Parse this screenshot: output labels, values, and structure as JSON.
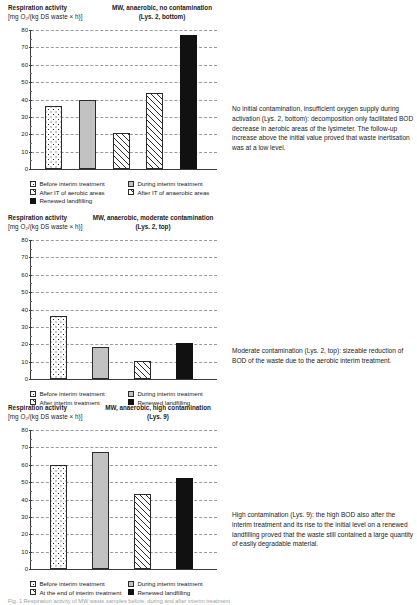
{
  "figure": {
    "caption": "Fig. 1 Respiration activity of MW waste samples before, during and after interim treatment"
  },
  "axis": {
    "y_title": "Respiration activity",
    "y_units": "[mg O₂/(kg DS waste × h)]",
    "ticks": [
      0,
      10,
      20,
      30,
      40,
      50,
      60,
      70,
      80
    ]
  },
  "charts": [
    {
      "id": "lys2-bottom",
      "title_line1": "MW, anaerobic, no contamination",
      "title_line2": "(Lys. 2, bottom)",
      "chart_data": {
        "type": "bar",
        "title": "MW, anaerobic, no contamination (Lys. 2, bottom)",
        "xlabel": "",
        "ylabel": "Respiration activity [mg O₂/(kg DS waste × h)]",
        "ylim": [
          0,
          80
        ],
        "grid": true,
        "legend_position": "below",
        "categories": [
          "Before interim treatment",
          "During interim treatment",
          "After IT of aerobic areas",
          "After IT of anaerobic areas",
          "Renewed landfilling"
        ],
        "values": [
          36,
          40,
          20.5,
          44,
          77
        ]
      },
      "legend": [
        {
          "label": "Before interim treatment",
          "fill": "dots"
        },
        {
          "label": "During interim treatment",
          "fill": "gray"
        },
        {
          "label": "After IT of aerobic areas",
          "fill": "hatch"
        },
        {
          "label": "After IT of anaerobic areas",
          "fill": "hatch"
        },
        {
          "label": "Renewed landfilling",
          "fill": "black"
        }
      ],
      "note": "No initial contamination, insufficient oxygen supply during activation (Lys. 2, bottom): decomposition only facilitated BOD decrease in aerobic areas of the lysimeter. The follow-up increase above the initial value proved that waste inertisation was at a low level."
    },
    {
      "id": "lys2-top",
      "title_line1": "MW, anaerobic, moderate contamination",
      "title_line2": "(Lys. 2, top)",
      "chart_data": {
        "type": "bar",
        "title": "MW, anaerobic, moderate contamination (Lys. 2, top)",
        "xlabel": "",
        "ylabel": "Respiration activity [mg O₂/(kg DS waste × h)]",
        "ylim": [
          0,
          80
        ],
        "grid": true,
        "legend_position": "below",
        "categories": [
          "Before interim treatment",
          "During interim treatment",
          "After interim treatment",
          "Renewed landfilling"
        ],
        "values": [
          36,
          18.5,
          10.5,
          21
        ]
      },
      "legend": [
        {
          "label": "Before interim treatment",
          "fill": "dots"
        },
        {
          "label": "During interim treatment",
          "fill": "gray"
        },
        {
          "label": "After interim treatment",
          "fill": "hatch"
        },
        {
          "label": "Renewed landfilling",
          "fill": "black"
        }
      ],
      "note": "Moderate contamination (Lys. 2, top): sizeable reduction of BOD of the waste due to the aerobic interim treatment."
    },
    {
      "id": "lys9",
      "title_line1": "MW, anaerobic, high contamination",
      "title_line2": "(Lys. 9)",
      "chart_data": {
        "type": "bar",
        "title": "MW, anaerobic, high contamination (Lys. 9)",
        "xlabel": "",
        "ylabel": "Respiration activity [mg O₂/(kg DS waste × h)]",
        "ylim": [
          0,
          80
        ],
        "grid": true,
        "legend_position": "below",
        "categories": [
          "Before interim treatment",
          "During interim treatment",
          "At the end of interim treatment",
          "Renewed landfilling"
        ],
        "values": [
          60,
          67.5,
          43,
          52.5
        ]
      },
      "legend": [
        {
          "label": "Before interim treatment",
          "fill": "dots"
        },
        {
          "label": "During interim treatment",
          "fill": "gray"
        },
        {
          "label": "At the end of interim treatment",
          "fill": "hatch"
        },
        {
          "label": "Renewed landfilling",
          "fill": "black"
        }
      ],
      "note": "High contamination (Lys. 9): the high BOD also after the interim treatment and its rise to the initial level on a renewed landfilling proved that the waste still contained a large quantity of easily degradable material."
    }
  ]
}
